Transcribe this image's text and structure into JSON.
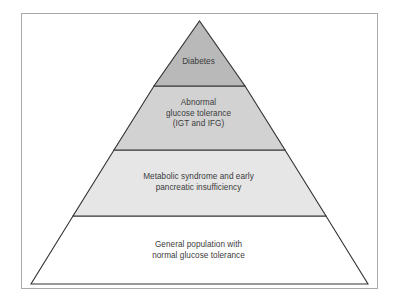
{
  "figure": {
    "type": "pyramid-diagram",
    "background_color": "#ffffff",
    "frame": {
      "border_color": "#a9a9a9",
      "fill_color": "#ffffff"
    },
    "outline_color": "#333333",
    "text_color": "#3b3b3b"
  },
  "pyramid": {
    "tiers": [
      {
        "index": 1,
        "name": "diabetes",
        "fill_color": "#b9b9b9",
        "lines": [
          "Diabetes"
        ]
      },
      {
        "index": 2,
        "name": "abnormal-glucose-tolerance",
        "fill_color": "#d2d2d2",
        "lines": [
          "Abnormal",
          "glucose tolerance",
          "(IGT and IFG)"
        ]
      },
      {
        "index": 3,
        "name": "metabolic-syndrome",
        "fill_color": "#e6e6e6",
        "lines": [
          "Metabolic syndrome and early",
          "pancreatic insufficiency"
        ]
      },
      {
        "index": 4,
        "name": "general-population",
        "fill_color": "#ffffff",
        "lines": [
          "General population with",
          "normal glucose tolerance"
        ]
      }
    ]
  }
}
